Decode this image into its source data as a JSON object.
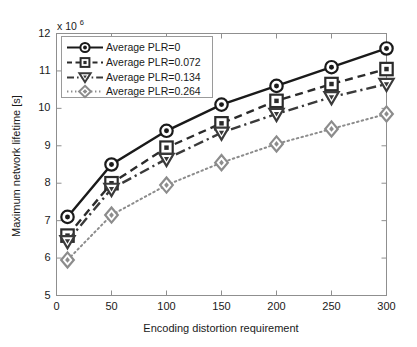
{
  "chart_data": {
    "type": "line",
    "title": "",
    "subtitle": "",
    "xlabel": "Encoding distortion requirement",
    "ylabel": "Maximum network lifetime [s]",
    "y_multiplier_text": "x 10",
    "y_multiplier_exponent": "6",
    "y_multiplier_value": 1000000,
    "x": [
      10,
      50,
      100,
      150,
      200,
      250,
      300
    ],
    "xlim": [
      0,
      300
    ],
    "ylim": [
      5,
      12
    ],
    "xticks": [
      0,
      50,
      100,
      150,
      200,
      250,
      300
    ],
    "yticks": [
      5,
      6,
      7,
      8,
      9,
      10,
      11,
      12
    ],
    "xtick_labels": [
      "0",
      "50",
      "100",
      "150",
      "200",
      "250",
      "300"
    ],
    "ytick_labels": [
      "5",
      "6",
      "7",
      "8",
      "9",
      "10",
      "11",
      "12"
    ],
    "grid": false,
    "legend_position": "upper left",
    "series": [
      {
        "name": "Average PLR=0",
        "marker": "circle",
        "linestyle": "solid",
        "color": "#1a1a1a",
        "values": [
          7.1,
          8.5,
          9.4,
          10.1,
          10.6,
          11.1,
          11.6
        ]
      },
      {
        "name": "Average PLR=0.072",
        "marker": "square",
        "linestyle": "dashed",
        "color": "#2b2b2b",
        "values": [
          6.6,
          8.0,
          8.95,
          9.6,
          10.2,
          10.65,
          11.05
        ]
      },
      {
        "name": "Average PLR=0.134",
        "marker": "triangle-down",
        "linestyle": "dashdot",
        "color": "#3a3a3a",
        "values": [
          6.45,
          7.85,
          8.65,
          9.35,
          9.85,
          10.3,
          10.65
        ]
      },
      {
        "name": "Average PLR=0.264",
        "marker": "diamond",
        "linestyle": "dotted",
        "color": "#8c8c8c",
        "values": [
          5.95,
          7.15,
          7.95,
          8.55,
          9.05,
          9.45,
          9.85
        ]
      }
    ]
  },
  "axes": {
    "frame_color": "#8f8f8f",
    "text_color": "#1a1a1a"
  }
}
